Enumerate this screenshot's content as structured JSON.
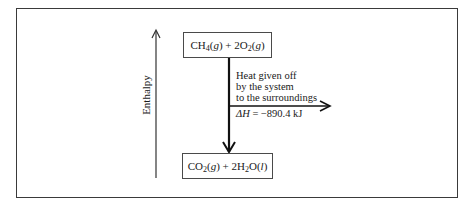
{
  "diagram": {
    "type": "enthalpy-diagram",
    "axis_label": "Enthalpy",
    "reactants": {
      "label": "CH4(g) + 2O2(g)",
      "parts": [
        "CH",
        "4",
        "(",
        "g",
        ") + 2O",
        "2",
        "(",
        "g",
        ")"
      ]
    },
    "products": {
      "label": "CO2(g) + 2H2O(l)",
      "parts": [
        "CO",
        "2",
        "(",
        "g",
        ") + 2H",
        "2",
        "O(",
        "l",
        ")"
      ]
    },
    "heat_annotation": {
      "line1": "Heat given off",
      "line2": "by the system",
      "line3": "to the surroundings"
    },
    "delta_h": {
      "symbol": "ΔH",
      "text": " = −890.4 kJ",
      "value": -890.4,
      "unit": "kJ"
    },
    "colors": {
      "line": "#1a1a1a",
      "frame": "#3a3a3a",
      "background": "#ffffff"
    }
  }
}
